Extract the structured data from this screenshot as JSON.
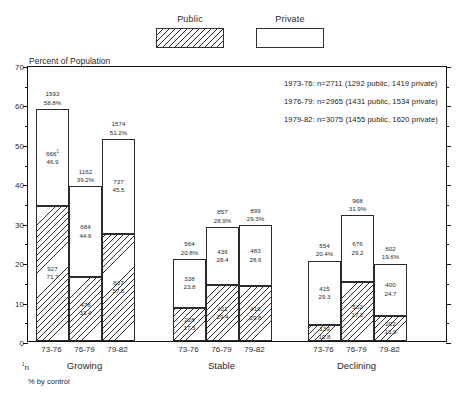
{
  "legend": {
    "items": [
      {
        "label": "Public",
        "fill": "hatched"
      },
      {
        "label": "Private",
        "fill": "white"
      }
    ]
  },
  "annotation": {
    "lines": [
      "1973-76: n=2711 (1292 public, 1419 private)",
      "1976-79: n=2965 (1431 public, 1534 private)",
      "1979-82: n=3075 (1455 public, 1620 private)"
    ]
  },
  "footnote": {
    "marker": "1",
    "marker_text": "n",
    "text": "% by control"
  },
  "chart_data": {
    "type": "bar",
    "title": "",
    "subtype": "stacked-grouped",
    "ylabel": "Percent of Population",
    "xlabel": "",
    "ylim": [
      0,
      70
    ],
    "ytick_step": 10,
    "yminor_step": 5,
    "ytick_labels": [
      "0",
      "10",
      "20",
      "30",
      "40",
      "50",
      "60",
      "70"
    ],
    "grid": false,
    "legend_position": "top-center",
    "group_names": [
      "Growing",
      "Stable",
      "Declining"
    ],
    "period_labels": [
      "73-76",
      "76-79",
      "79-82"
    ],
    "series": [
      {
        "name": "Public",
        "fill": "hatched"
      },
      {
        "name": "Private",
        "fill": "white"
      }
    ],
    "groups": [
      {
        "name": "Growing",
        "bars": [
          {
            "period": "73-76",
            "total_n": "1593",
            "total_pct": "58.8%",
            "total_value": 58.8,
            "public": {
              "n": "927",
              "pct": "71.7",
              "value": 34.3
            },
            "private": {
              "n": "666",
              "pct": "46.9",
              "value": 24.5,
              "superscript": "1"
            }
          },
          {
            "period": "76-79",
            "total_n": "1162",
            "total_pct": "39.2%",
            "total_value": 39.2,
            "public": {
              "n": "478",
              "pct": "33.4",
              "value": 16.2
            },
            "private": {
              "n": "684",
              "pct": "44.6",
              "value": 23.0
            }
          },
          {
            "period": "79-82",
            "total_n": "1574",
            "total_pct": "51.2%",
            "total_value": 51.2,
            "public": {
              "n": "837",
              "pct": "57.5",
              "value": 27.2
            },
            "private": {
              "n": "737",
              "pct": "45.5",
              "value": 24.0
            }
          }
        ]
      },
      {
        "name": "Stable",
        "bars": [
          {
            "period": "73-76",
            "total_n": "564",
            "total_pct": "20.8%",
            "total_value": 20.8,
            "public": {
              "n": "228",
              "pct": "17.5",
              "value": 8.4
            },
            "private": {
              "n": "338",
              "pct": "23.8",
              "value": 12.4
            }
          },
          {
            "period": "76-79",
            "total_n": "857",
            "total_pct": "28.9%",
            "total_value": 28.9,
            "public": {
              "n": "421",
              "pct": "29.4",
              "value": 14.2
            },
            "private": {
              "n": "436",
              "pct": "28.4",
              "value": 14.7
            }
          },
          {
            "period": "79-82",
            "total_n": "899",
            "total_pct": "29.3%",
            "total_value": 29.3,
            "public": {
              "n": "416",
              "pct": "29.8",
              "value": 13.9
            },
            "private": {
              "n": "483",
              "pct": "28.6",
              "value": 15.4
            }
          }
        ]
      },
      {
        "name": "Declining",
        "bars": [
          {
            "period": "73-76",
            "total_n": "554",
            "total_pct": "20.4%",
            "total_value": 20.4,
            "public": {
              "n": "139",
              "pct": "10.8",
              "value": 4.0
            },
            "private": {
              "n": "415",
              "pct": "29.3",
              "value": 16.4
            }
          },
          {
            "period": "76-79",
            "total_n": "968",
            "total_pct": "31.9%",
            "total_value": 31.9,
            "public": {
              "n": "532",
              "pct": "17.2",
              "value": 15.0
            },
            "private": {
              "n": "676",
              "pct": "29.2",
              "value": 16.9
            }
          },
          {
            "period": "79-82",
            "total_n": "602",
            "total_pct": "19.6%",
            "total_value": 19.6,
            "public": {
              "n": "202",
              "pct": "13.9",
              "value": 6.4
            },
            "private": {
              "n": "400",
              "pct": "24.7",
              "value": 13.2
            }
          }
        ]
      }
    ]
  }
}
